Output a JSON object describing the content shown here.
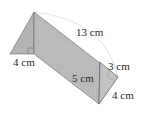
{
  "figure": {
    "type": "triangular-prism",
    "colors": {
      "face_fill": "#b8b8b8",
      "face_fill_light": "#c4c4c4",
      "edge": "#555555",
      "dimension_arc": "#e2e2e2"
    }
  },
  "labels": {
    "hypotenuse": "13 cm",
    "base_left": "4 cm",
    "height": "5 cm",
    "side_3": "3 cm",
    "side_4": "4 cm"
  }
}
